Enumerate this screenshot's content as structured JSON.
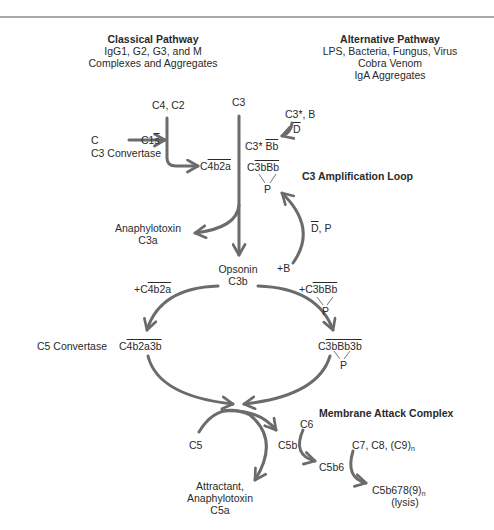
{
  "classical": {
    "title": "Classical Pathway",
    "line1": "IgG1, G2, G3, and M",
    "line2": "Complexes and Aggregates"
  },
  "alternative": {
    "title": "Alternative Pathway",
    "line1": "LPS, Bacteria, Fungus, Virus",
    "line2": "Cobra Venom",
    "line3": "IgA Aggregates"
  },
  "nodes": {
    "c4c2": "C4, C2",
    "c3_top": "C3",
    "c": "C",
    "c1s": "C1",
    "c1s_bar": "s",
    "c3_convertase_label": "C3 Convertase",
    "c4b2a_prefix": "C",
    "c4b2a_bar": "4b2a",
    "c3star_b": "C3*, B",
    "d_bar": "D",
    "c3star": "C3*",
    "bb_bar": "Bb",
    "c3bbb_prefix": "C",
    "c3bbb_bar": "3bBb",
    "p": "P",
    "amplification_title": "C3 Amplification Loop",
    "d_p_rest": ", P",
    "anaphylotoxin": "Anaphylotoxin",
    "c3a": "C3a",
    "plus_b": "+B",
    "opsonin": "Opsonin",
    "c3b": "C3b",
    "plus_c4b2a_prefix": "+C",
    "plus_c4b2a_bar": "4b2a",
    "plus_c3bbb_prefix": "+C",
    "plus_c3bbb_bar": "3bBb",
    "c5_convertase_label": "C5 Convertase",
    "c4b2a3b_prefix": "C",
    "c4b2a3b_bar": "4b2a3b",
    "c3bbb3b_prefix": "C",
    "c3bbb3b_bar": "3bBb3b",
    "mac_title": "Membrane Attack Complex",
    "c5": "C5",
    "c5b": "C5b",
    "c6": "C6",
    "c5b6": "C5b6",
    "c7c8c9": "C7, C8, (C9)",
    "n": "n",
    "c5b6789": "C5b678(9)",
    "lysis": "(lysis)",
    "attractant": "Attractant,",
    "anaphylotoxin2": "Anaphylotoxin",
    "c5a": "C5a"
  },
  "colors": {
    "arrow": "#6b6b6b",
    "text": "#2a2a2a",
    "rule": "#555555"
  }
}
